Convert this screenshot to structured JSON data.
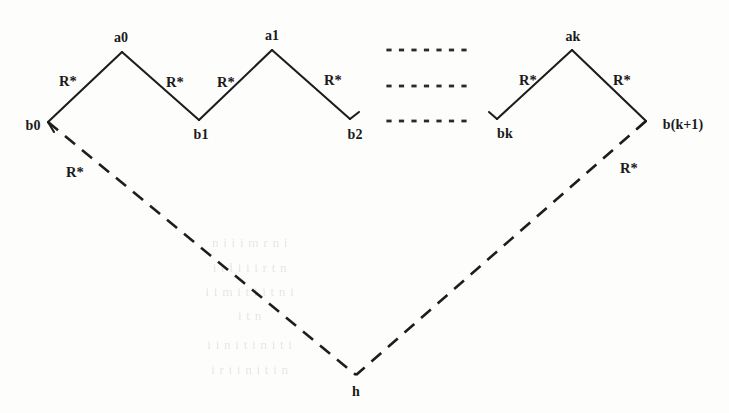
{
  "figure": {
    "background_color": "#fdfdfc",
    "stroke_color": "#1d1d1d",
    "label_color": "#1a1a1a"
  },
  "chart_data": {
    "type": "diagram",
    "title": "",
    "nodes": [
      {
        "id": "b0",
        "label": "b0",
        "x": 48,
        "y": 122,
        "kind": "valley"
      },
      {
        "id": "a0",
        "label": "a0",
        "x": 122,
        "y": 52,
        "kind": "peak"
      },
      {
        "id": "b1",
        "label": "b1",
        "x": 199,
        "y": 120,
        "kind": "valley"
      },
      {
        "id": "a1",
        "label": "a1",
        "x": 272,
        "y": 50,
        "kind": "peak"
      },
      {
        "id": "b2",
        "label": "b2",
        "x": 350,
        "y": 119,
        "kind": "valley"
      },
      {
        "id": "bk",
        "label": "bk",
        "x": 497,
        "y": 119,
        "kind": "valley"
      },
      {
        "id": "ak",
        "label": "ak",
        "x": 572,
        "y": 50,
        "kind": "peak"
      },
      {
        "id": "bk1",
        "label": "b(k+1)",
        "x": 646,
        "y": 121,
        "kind": "valley"
      },
      {
        "id": "h",
        "label": "h",
        "x": 356,
        "y": 375,
        "kind": "apex"
      }
    ],
    "node_label_positions": [
      {
        "id": "b0",
        "text": "b0",
        "x": 33,
        "y": 126
      },
      {
        "id": "a0",
        "text": "a0",
        "x": 121,
        "y": 38
      },
      {
        "id": "b1",
        "text": "b1",
        "x": 201,
        "y": 135
      },
      {
        "id": "a1",
        "text": "a1",
        "x": 272,
        "y": 36
      },
      {
        "id": "b2",
        "text": "b2",
        "x": 355,
        "y": 135
      },
      {
        "id": "bk",
        "text": "bk",
        "x": 505,
        "y": 134
      },
      {
        "id": "ak",
        "text": "ak",
        "x": 573,
        "y": 37
      },
      {
        "id": "bk1",
        "text": "b(k+1)",
        "x": 683,
        "y": 125
      },
      {
        "id": "h",
        "text": "h",
        "x": 356,
        "y": 392
      }
    ],
    "edges": [
      {
        "from": "b0",
        "to": "a0",
        "style": "solid",
        "label": "R*"
      },
      {
        "from": "a0",
        "to": "b1",
        "style": "solid",
        "label": "R*"
      },
      {
        "from": "b1",
        "to": "a1",
        "style": "solid",
        "label": "R*"
      },
      {
        "from": "a1",
        "to": "b2",
        "style": "solid",
        "label": "R*"
      },
      {
        "from": "bk",
        "to": "ak",
        "style": "solid",
        "label": "R*"
      },
      {
        "from": "ak",
        "to": "bk1",
        "style": "solid",
        "label": "R*"
      },
      {
        "from": "b0",
        "to": "h",
        "style": "dashed",
        "label": "R*"
      },
      {
        "from": "bk1",
        "to": "h",
        "style": "dashed",
        "label": "R*"
      }
    ],
    "edge_labels": [
      {
        "text": "R*",
        "x": 68,
        "y": 81,
        "edge": "b0-a0"
      },
      {
        "text": "R*",
        "x": 175,
        "y": 82,
        "edge": "a0-b1"
      },
      {
        "text": "R*",
        "x": 226,
        "y": 82,
        "edge": "b1-a1"
      },
      {
        "text": "R*",
        "x": 333,
        "y": 80,
        "edge": "a1-b2"
      },
      {
        "text": "R*",
        "x": 528,
        "y": 80,
        "edge": "bk-ak"
      },
      {
        "text": "R*",
        "x": 622,
        "y": 80,
        "edge": "ak-bk1"
      },
      {
        "text": "R*",
        "x": 75,
        "y": 172,
        "edge": "b0-h"
      },
      {
        "text": "R*",
        "x": 629,
        "y": 168,
        "edge": "bk1-h"
      }
    ],
    "ellipsis_rows": [
      {
        "y": 50,
        "x_start": 389,
        "x_end": 464,
        "dots": 7
      },
      {
        "y": 86,
        "x_start": 389,
        "x_end": 464,
        "dots": 7
      },
      {
        "y": 121,
        "x_start": 389,
        "x_end": 464,
        "dots": 7
      }
    ],
    "hooks": [
      {
        "at": "b2",
        "note": "short up-right tick at line end"
      },
      {
        "at": "bk",
        "note": "short up-left tick at line start"
      },
      {
        "at": "b0",
        "note": "short tick below node"
      },
      {
        "at": "bk1",
        "note": "short tick below-left node"
      }
    ]
  },
  "ghost_text": {
    "note": "faint show-through text from reverse of the scanned page; illegible",
    "lines": [
      {
        "x": 250,
        "y": 243,
        "text": "n   i   i  i   m   r   n   i"
      },
      {
        "x": 250,
        "y": 268,
        "text": "i     t   l i    i    i   r    t  n"
      },
      {
        "x": 250,
        "y": 292,
        "text": "i    i  m  i t  i    i   t  n   i"
      },
      {
        "x": 250,
        "y": 316,
        "text": "i    t  n"
      },
      {
        "x": 250,
        "y": 345,
        "text": "i   i   n  i   t   i    n   i  t  i"
      },
      {
        "x": 250,
        "y": 370,
        "text": "i   r   i   i    n  i    t   i  n"
      }
    ]
  }
}
